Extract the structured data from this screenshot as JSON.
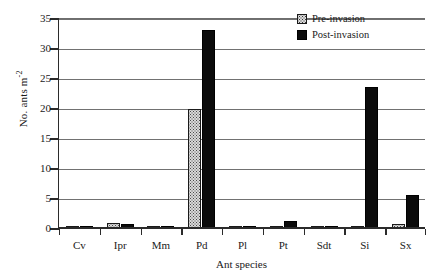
{
  "chart_data": {
    "type": "bar",
    "title": "",
    "xlabel": "Ant species",
    "ylabel": "No. ants m",
    "ylabel_exponent": "-2",
    "ylim": [
      0,
      35
    ],
    "yticks": [
      0,
      5,
      10,
      15,
      20,
      25,
      30,
      35
    ],
    "grid": true,
    "legend_position": "top-right",
    "categories": [
      "Cv",
      "Ipr",
      "Mm",
      "Pd",
      "Pl",
      "Pt",
      "Sdt",
      "Si",
      "Sx"
    ],
    "series": [
      {
        "name": "Pre-invasion",
        "color": "#d9d9d9",
        "pattern": "stipple",
        "values": [
          0.2,
          0.9,
          0.3,
          19.8,
          0.1,
          0.4,
          0.4,
          0.1,
          0.7
        ]
      },
      {
        "name": "Post-invasion",
        "color": "#0b0b0b",
        "pattern": "solid",
        "values": [
          0.2,
          0.7,
          0.2,
          33.0,
          0.1,
          1.2,
          0.1,
          23.5,
          5.5
        ]
      }
    ]
  },
  "axes": {
    "y_title_text": "No. ants m",
    "y_title_sup": "-2",
    "x_title_text": "Ant species"
  }
}
